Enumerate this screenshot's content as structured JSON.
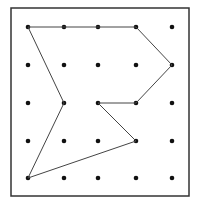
{
  "diagram": {
    "type": "dot-grid-polygon",
    "grid": {
      "columns": 5,
      "rows": 5,
      "x_positions": [
        28,
        64,
        98,
        136,
        172
      ],
      "y_positions": [
        27,
        65,
        103,
        141,
        178
      ],
      "dot_radius": 2.3,
      "dot_color": "#111111"
    },
    "frame": {
      "x": 11,
      "y": 8,
      "width": 178,
      "height": 188,
      "stroke": "#333333",
      "stroke_width": 1.5
    },
    "polygon": {
      "stroke": "#444444",
      "stroke_width": 1,
      "vertices": [
        {
          "col": 0,
          "row": 0
        },
        {
          "col": 3,
          "row": 0
        },
        {
          "col": 4,
          "row": 1
        },
        {
          "col": 3,
          "row": 2
        },
        {
          "col": 2,
          "row": 2
        },
        {
          "col": 3,
          "row": 3
        },
        {
          "col": 0,
          "row": 4
        },
        {
          "col": 1,
          "row": 2
        }
      ]
    }
  }
}
